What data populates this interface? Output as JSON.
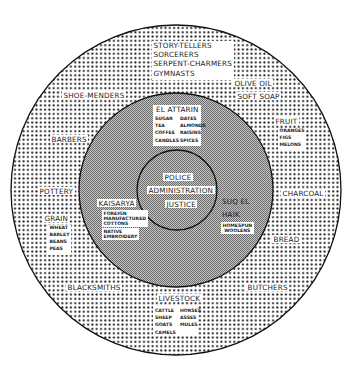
{
  "diagram": {
    "rings": {
      "outer": {
        "cx": 176,
        "cy": 190,
        "r": 165,
        "fill": "dotted",
        "dot_color": "#1a1a1a"
      },
      "middle": {
        "cx": 176,
        "cy": 190,
        "r": 97,
        "fill": "fine-hatch",
        "color": "#9a9a9a"
      },
      "inner": {
        "cx": 177,
        "cy": 190,
        "r": 40,
        "fill": "fine-hatch",
        "color": "#9a9a9a"
      }
    },
    "center": {
      "items": [
        "POLICE",
        "ADMINISTRATION",
        "JUSTICE"
      ]
    },
    "middle_ring": {
      "el_attarin": {
        "title": "EL ATTARIN",
        "col1": [
          "SUGAR",
          "TEA",
          "COFFEE",
          "CANDLES"
        ],
        "col2": [
          "DATES",
          "ALMONDS",
          "RAISINS",
          "SPICES"
        ]
      },
      "kaisarya": {
        "title": "KAISARYA",
        "group1": [
          "FOREIGN",
          "MANUFACTURED",
          "COTTONS"
        ],
        "group2": [
          "NATIVE",
          "EMBROIDERY"
        ]
      },
      "suq_el_haik": {
        "title_line1": "SUQ EL",
        "title_line2": "HAIK",
        "goods": [
          "HOMESPUN",
          "WOOLENS"
        ]
      }
    },
    "outer_ring": {
      "entertainers": [
        "STORY-TELLERS",
        "SORCERERS",
        "SERPENT-CHARMERS",
        "GYMNASTS"
      ],
      "olive_oil": "OLIVE OIL",
      "soft_soap": "SOFT SOAP",
      "shoe_menders": "SHOE-MENDERS",
      "fruit": {
        "title": "FRUIT",
        "items": [
          "ORANGES",
          "FIGS",
          "MELONS"
        ]
      },
      "barbers": "BARBERS",
      "pottery": "POTTERY",
      "charcoal": "CHARCOAL",
      "grain": {
        "title": "GRAIN",
        "items": [
          "WHEAT",
          "BARLEY",
          "BEANS",
          "PEAS"
        ]
      },
      "bread": "BREAD",
      "blacksmiths": "BLACKSMITHS",
      "butchers": "BUTCHERS",
      "livestock": {
        "title": "LIVESTOCK",
        "col1": [
          "CATTLE",
          "SHEEP",
          "GOATS",
          "CAMELS"
        ],
        "col2": [
          "HORSES",
          "ASSES",
          "MULES"
        ]
      }
    }
  }
}
